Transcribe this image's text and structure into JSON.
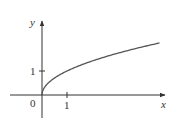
{
  "chart_data": {
    "type": "line",
    "title": "",
    "xlabel": "x",
    "ylabel": "y",
    "series": [
      {
        "name": "y = sqrt(x)",
        "x": [
          0,
          0.25,
          0.5,
          1,
          1.5,
          2,
          2.5,
          3,
          3.5,
          4,
          4.5,
          4.7
        ],
        "values": [
          0,
          0.5,
          0.707,
          1,
          1.225,
          1.414,
          1.581,
          1.732,
          1.871,
          2,
          2.121,
          2.168
        ]
      }
    ],
    "x_ticks": [
      {
        "value": 1,
        "label": "1"
      }
    ],
    "y_ticks": [
      {
        "value": 1,
        "label": "1"
      }
    ],
    "origin_label": "0",
    "xlim": [
      -1.2,
      4.9
    ],
    "ylim": [
      -0.9,
      3.0
    ],
    "grid": false,
    "legend": null
  },
  "axes": {
    "x_label": "x",
    "y_label": "y",
    "origin_label": "0",
    "x_tick_label": "1",
    "y_tick_label": "1"
  },
  "colors": {
    "axis": "#333333",
    "curve": "#555555"
  }
}
